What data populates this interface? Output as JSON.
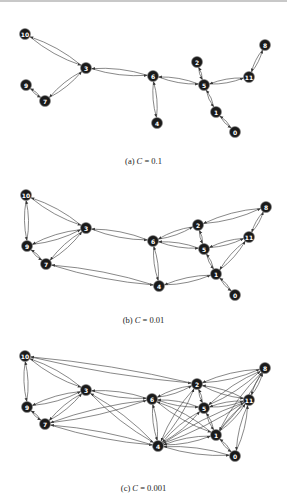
{
  "figure": {
    "panels": [
      {
        "id": "a",
        "caption_prefix": "(a) ",
        "caption_var": "C",
        "caption_eq": " = 0.1",
        "caption_y": 156,
        "nodes": {
          "0": [
            235,
            132
          ],
          "1": [
            216,
            112
          ],
          "2": [
            197,
            62
          ],
          "3": [
            86,
            68
          ],
          "4": [
            157,
            123
          ],
          "5": [
            204,
            85
          ],
          "6": [
            153,
            76
          ],
          "7": [
            45,
            101
          ],
          "8": [
            265,
            45
          ],
          "9": [
            26,
            85
          ],
          "10": [
            25,
            34
          ],
          "11": [
            249,
            77
          ]
        },
        "edges": [
          [
            "10",
            "3"
          ],
          [
            "3",
            "7"
          ],
          [
            "9",
            "7"
          ],
          [
            "3",
            "6"
          ],
          [
            "6",
            "4"
          ],
          [
            "6",
            "5"
          ],
          [
            "2",
            "5"
          ],
          [
            "5",
            "1"
          ],
          [
            "1",
            "0"
          ],
          [
            "5",
            "11"
          ],
          [
            "11",
            "8"
          ]
        ]
      },
      {
        "id": "b",
        "caption_prefix": "(b) ",
        "caption_var": "C",
        "caption_eq": " = 0.01",
        "caption_y": 315,
        "nodes": {
          "0": [
            235,
            295
          ],
          "1": [
            216,
            274
          ],
          "2": [
            198,
            225
          ],
          "3": [
            86,
            228
          ],
          "4": [
            159,
            286
          ],
          "5": [
            204,
            249
          ],
          "6": [
            153,
            241
          ],
          "7": [
            46,
            264
          ],
          "8": [
            266,
            207
          ],
          "9": [
            27,
            246
          ],
          "10": [
            26,
            195
          ],
          "11": [
            249,
            237
          ]
        },
        "edges": [
          [
            "10",
            "3"
          ],
          [
            "10",
            "9"
          ],
          [
            "9",
            "3"
          ],
          [
            "9",
            "7"
          ],
          [
            "7",
            "3"
          ],
          [
            "3",
            "6"
          ],
          [
            "7",
            "4"
          ],
          [
            "6",
            "4"
          ],
          [
            "6",
            "2"
          ],
          [
            "6",
            "5"
          ],
          [
            "2",
            "5"
          ],
          [
            "2",
            "8"
          ],
          [
            "5",
            "1"
          ],
          [
            "5",
            "11"
          ],
          [
            "11",
            "8"
          ],
          [
            "11",
            "1"
          ],
          [
            "4",
            "1"
          ],
          [
            "1",
            "0"
          ]
        ]
      },
      {
        "id": "c",
        "caption_prefix": "(c) ",
        "caption_var": "C",
        "caption_eq": " = 0.001",
        "caption_y": 483,
        "nodes": {
          "0": [
            235,
            456
          ],
          "1": [
            216,
            435
          ],
          "2": [
            197,
            384
          ],
          "3": [
            86,
            390
          ],
          "4": [
            158,
            446
          ],
          "5": [
            204,
            408
          ],
          "6": [
            152,
            399
          ],
          "7": [
            45,
            424
          ],
          "8": [
            265,
            368
          ],
          "9": [
            27,
            407
          ],
          "10": [
            25,
            356
          ],
          "11": [
            249,
            400
          ]
        },
        "edges": [
          [
            "10",
            "3"
          ],
          [
            "10",
            "9"
          ],
          [
            "10",
            "2"
          ],
          [
            "9",
            "3"
          ],
          [
            "9",
            "7"
          ],
          [
            "7",
            "3"
          ],
          [
            "3",
            "6"
          ],
          [
            "3",
            "4"
          ],
          [
            "7",
            "6"
          ],
          [
            "7",
            "4"
          ],
          [
            "6",
            "4"
          ],
          [
            "6",
            "2"
          ],
          [
            "6",
            "5"
          ],
          [
            "6",
            "1"
          ],
          [
            "2",
            "5"
          ],
          [
            "2",
            "8"
          ],
          [
            "2",
            "11"
          ],
          [
            "2",
            "4"
          ],
          [
            "5",
            "1"
          ],
          [
            "5",
            "11"
          ],
          [
            "5",
            "8"
          ],
          [
            "5",
            "4"
          ],
          [
            "11",
            "8"
          ],
          [
            "11",
            "1"
          ],
          [
            "11",
            "0"
          ],
          [
            "11",
            "4"
          ],
          [
            "4",
            "1"
          ],
          [
            "4",
            "0"
          ],
          [
            "1",
            "0"
          ],
          [
            "8",
            "1"
          ]
        ]
      }
    ]
  },
  "style": {
    "node_fill": "#1a1a1a",
    "node_stroke": "#8a8a8a",
    "edge_color": "#555555",
    "label_color": "#ffffff"
  }
}
